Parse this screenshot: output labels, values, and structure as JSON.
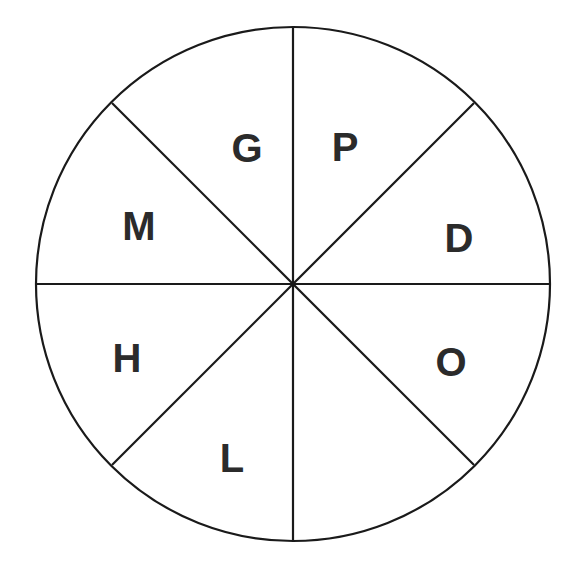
{
  "figure": {
    "name": "sector-wheel-diagram",
    "type": "circle-divided-into-eight-sectors",
    "background_color": "#ffffff",
    "stroke_color": "#1a1a1a",
    "label_color": "#2b2b2b",
    "stroke_width": 2.2,
    "circle": {
      "center_x": 293,
      "center_y": 284,
      "radius": 257
    },
    "divider_count": 4,
    "sector_count": 8
  },
  "dividers": [
    {
      "name": "vertical-diameter",
      "angle_deg": 90
    },
    {
      "name": "horizontal-diameter",
      "angle_deg": 0
    },
    {
      "name": "diagonal-diameter-nw-se",
      "angle_deg": 135
    },
    {
      "name": "diagonal-diameter-ne-sw",
      "angle_deg": 45
    }
  ],
  "sectors": [
    {
      "id": "sector-g",
      "label": "G",
      "start_deg": 90,
      "end_deg": 135,
      "label_x": 247,
      "label_y": 151
    },
    {
      "id": "sector-m",
      "label": "M",
      "start_deg": 135,
      "end_deg": 180,
      "label_x": 139,
      "label_y": 229
    },
    {
      "id": "sector-h",
      "label": "H",
      "start_deg": 180,
      "end_deg": 225,
      "label_x": 127,
      "label_y": 361
    },
    {
      "id": "sector-l",
      "label": "L",
      "start_deg": 225,
      "end_deg": 270,
      "label_x": 232,
      "label_y": 461
    },
    {
      "id": "sector-unlabeled",
      "label": "",
      "start_deg": 270,
      "end_deg": 315,
      "label_x": 360,
      "label_y": 461
    },
    {
      "id": "sector-o",
      "label": "O",
      "start_deg": 315,
      "end_deg": 360,
      "label_x": 451,
      "label_y": 365
    },
    {
      "id": "sector-d",
      "label": "D",
      "start_deg": 0,
      "end_deg": 45,
      "label_x": 459,
      "label_y": 241
    },
    {
      "id": "sector-p",
      "label": "P",
      "start_deg": 45,
      "end_deg": 90,
      "label_x": 345,
      "label_y": 150
    }
  ],
  "chart_data": {
    "type": "pie",
    "title": "",
    "subtitle": "",
    "xlabel": "",
    "ylabel": "",
    "legend_position": "none",
    "grid": false,
    "equal_slices": true,
    "slice_angle_deg": 45,
    "categories": [
      "P",
      "D",
      "O",
      "",
      "L",
      "H",
      "M",
      "G"
    ],
    "values": [
      12.5,
      12.5,
      12.5,
      12.5,
      12.5,
      12.5,
      12.5,
      12.5
    ],
    "labels_clockwise_from_top": [
      "P",
      "D",
      "O",
      "",
      "L",
      "H",
      "M",
      "G"
    ],
    "annotations": [
      "G",
      "P",
      "D",
      "O",
      "L",
      "H",
      "M"
    ],
    "note": "Circle split into 8 equal 45-degree sectors; seven sectors bear a single bold capital letter, the lower-right-lower sector is blank."
  }
}
